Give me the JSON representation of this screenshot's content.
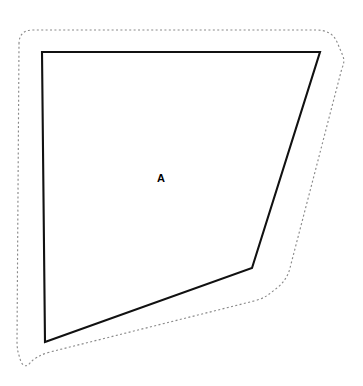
{
  "figure": {
    "width": 363,
    "height": 386,
    "background_color": "#ffffff"
  },
  "parcel": {
    "label": "A",
    "label_position": {
      "x": 161,
      "y": 179
    },
    "stroke_color": "#111111",
    "fill_color": "#ffffff",
    "stroke_width": 2.1,
    "vertices": [
      {
        "x": 42,
        "y": 52
      },
      {
        "x": 320,
        "y": 52
      },
      {
        "x": 252,
        "y": 268
      },
      {
        "x": 45,
        "y": 342
      }
    ],
    "path": "M 42 52 L 320 52 L 252 268 L 45 342 Z"
  },
  "buffer": {
    "stroke_color": "#8a8a8a",
    "stroke_width": 1.15,
    "dash_pattern": "2 2.4",
    "style": "dotted",
    "path": "M 19 44 Q 19 30 33 30 L 316 30 Q 332 30 337 42 L 343 56 Q 345 62 342 68 L 290 268 Q 287 280 277 288 L 268 295 Q 262 299 254 301 L 50 352 Q 36 356 30 363 Q 25 369 21 362 L 18 352 Q 17 347 17 341 Z"
  },
  "legend": {
    "solid_line_meaning": "parcel boundary",
    "dotted_line_meaning": "offset buffer"
  }
}
